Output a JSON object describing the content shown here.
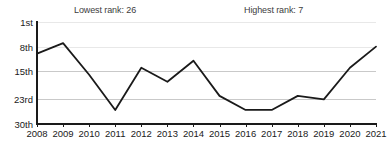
{
  "chart_data": {
    "type": "line",
    "title": "",
    "subtitle": "",
    "xlabel": "",
    "ylabel": "",
    "grid": true,
    "legend_position": "none",
    "x": [
      2008,
      2009,
      2010,
      2011,
      2012,
      2013,
      2014,
      2015,
      2016,
      2017,
      2018,
      2019,
      2020,
      2021
    ],
    "categories": [
      "2008",
      "2009",
      "2010",
      "2011",
      "2012",
      "2013",
      "2014",
      "2015",
      "2016",
      "2017",
      "2018",
      "2019",
      "2020",
      "2021"
    ],
    "values": [
      10,
      7,
      16,
      26,
      14,
      18,
      12,
      22,
      26,
      26,
      22,
      23,
      14,
      8
    ],
    "series": [
      {
        "name": "rank",
        "values": [
          10,
          7,
          16,
          26,
          14,
          18,
          12,
          22,
          26,
          26,
          22,
          23,
          14,
          8
        ]
      }
    ],
    "ylim": [
      1,
      30
    ],
    "y_inverted": true,
    "ytick_values": [
      1,
      8,
      15,
      23,
      30
    ],
    "ytick_labels": [
      "1st",
      "8th",
      "15th",
      "23rd",
      "30th"
    ],
    "xtick_labels": [
      "2008",
      "2009",
      "2010",
      "2011",
      "2012",
      "2013",
      "2014",
      "2015",
      "2016",
      "2017",
      "2018",
      "2019",
      "2020",
      "2021"
    ],
    "annotations": [
      {
        "id": "lowest",
        "text": "Lowest rank: 26"
      },
      {
        "id": "highest",
        "text": "Highest rank: 7"
      }
    ],
    "colors": {
      "line": "#1a1a1a",
      "grid": "#e8e8e8",
      "grid_major": "#c9c9c9",
      "axis": "#1a1a1a",
      "text": "#1a1a1a",
      "annotation_text": "#3d3d3d",
      "background": "#ffffff"
    }
  }
}
